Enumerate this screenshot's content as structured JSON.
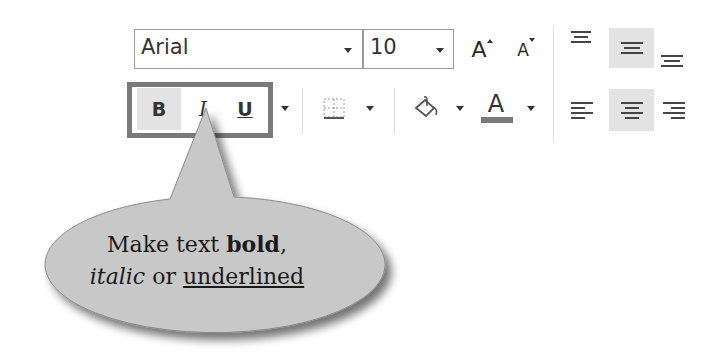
{
  "toolbar": {
    "font_name": {
      "value": "Arial",
      "dropdown_icon": "chevron-down-icon"
    },
    "font_size": {
      "value": "10",
      "dropdown_icon": "chevron-down-icon"
    },
    "grow_font": {
      "glyph": "A",
      "icon": "increase-font-size-icon"
    },
    "shrink_font": {
      "glyph": "A",
      "icon": "decrease-font-size-icon"
    },
    "bold": {
      "label": "B",
      "selected": true
    },
    "italic": {
      "label": "I",
      "selected": false
    },
    "underline": {
      "label": "U",
      "selected": false
    },
    "underline_dropdown_icon": "chevron-down-icon",
    "borders": {
      "icon": "borders-icon",
      "dropdown_icon": "chevron-down-icon"
    },
    "fill_color": {
      "icon": "paint-bucket-icon",
      "dropdown_icon": "chevron-down-icon",
      "color": "#808080"
    },
    "font_color": {
      "glyph": "A",
      "icon": "font-color-icon",
      "dropdown_icon": "chevron-down-icon",
      "color": "#7a7a7a"
    },
    "vertical_align": [
      {
        "name": "top-align",
        "selected": false
      },
      {
        "name": "middle-align",
        "selected": true
      },
      {
        "name": "bottom-align",
        "selected": false
      }
    ],
    "horizontal_align": [
      {
        "name": "align-left",
        "selected": false
      },
      {
        "name": "center",
        "selected": true
      },
      {
        "name": "align-right",
        "selected": false
      }
    ]
  },
  "callout": {
    "line1_prefix": "Make text ",
    "line1_bold": "bold",
    "line1_suffix": ",",
    "line2_italic": "italic",
    "line2_middle": " or ",
    "line2_underlined": "underlined",
    "fill_color": "#c8c8c8",
    "highlight_border_color": "#7a7a7a"
  }
}
